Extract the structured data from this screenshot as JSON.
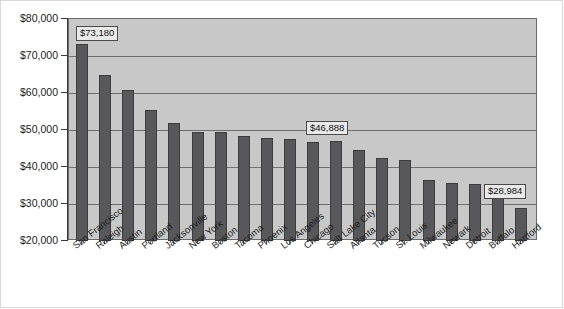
{
  "chart_data": {
    "type": "bar",
    "title": "",
    "subtitle": "",
    "xlabel": "",
    "ylabel": "",
    "ylim": [
      20000,
      80000
    ],
    "grid": true,
    "legend": false,
    "legend_position": "none",
    "y_tick_labels": [
      "$80,000",
      "$70,000",
      "$60,000",
      "$50,000",
      "$40,000",
      "$30,000",
      "$20,000"
    ],
    "y_tick_values": [
      80000,
      70000,
      60000,
      50000,
      40000,
      30000,
      20000
    ],
    "categories": [
      "San Francisco",
      "Raleigh",
      "Austin",
      "Portland",
      "Jacksonville",
      "New York",
      "Boston",
      "Tacoma",
      "Phoenix",
      "Los Angeles",
      "Chicago",
      "Salt Lake City",
      "Atlanta",
      "Tucson",
      "St. Louis",
      "Milwaukee",
      "Newark",
      "Detroit",
      "Buffalo",
      "Hartford"
    ],
    "values": [
      73180,
      65000,
      60700,
      55400,
      52000,
      49500,
      49400,
      48500,
      47900,
      47600,
      46888,
      47000,
      44600,
      42300,
      41800,
      36500,
      35700,
      35300,
      33700,
      28984
    ],
    "annotations": [
      {
        "category": "San Francisco",
        "label": "$73,180",
        "value": 73180
      },
      {
        "category": "Chicago",
        "label": "$46,888",
        "value": 46888
      },
      {
        "category": "Hartford",
        "label": "$28,984",
        "value": 28984
      }
    ],
    "colors": {
      "bar": "#58585a",
      "bar_border": "#3c3c3e",
      "plot_background": "#c8c8c8",
      "gridline": "#6f6f6f",
      "axis": "#3a3a3a",
      "text": "#1c1c1c",
      "callout_background": "#e9e9e9",
      "callout_border": "#4a4a4a",
      "page_background": "#ffffff"
    }
  }
}
